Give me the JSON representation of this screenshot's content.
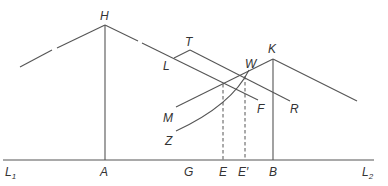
{
  "diagram": {
    "type": "geometric-construction",
    "line_color": "#555555",
    "label_color": "#333333",
    "labels": {
      "H": "H",
      "T": "T",
      "L": "L",
      "K": "K",
      "W": "W",
      "M": "M",
      "F": "F",
      "R": "R",
      "Z": "Z",
      "L1_main": "L",
      "L1_sub": "1",
      "A": "A",
      "G": "G",
      "E": "E",
      "E_prime": "E′",
      "B": "B",
      "L2_main": "L",
      "L2_sub": "2"
    },
    "points": {
      "H": [
        105,
        25
      ],
      "A": [
        105,
        160
      ],
      "K": [
        273,
        59
      ],
      "B": [
        273,
        160
      ],
      "T": [
        190,
        50
      ],
      "W": [
        249,
        70
      ],
      "E": [
        223,
        160
      ],
      "E_prime": [
        245,
        160
      ]
    },
    "elements": [
      "baseline L1–L2",
      "peak H with vertical HA",
      "peak K with vertical KB",
      "parallel lines L–F and T–R",
      "line M–K",
      "curve Z–W",
      "dashed verticals at E and E′"
    ]
  }
}
